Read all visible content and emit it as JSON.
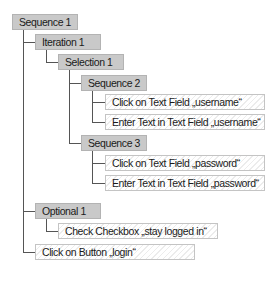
{
  "tree": {
    "sequence1": "Sequence 1",
    "iteration1": "Iteration 1",
    "selection1": "Selection 1",
    "sequence2": "Sequence 2",
    "click_username": "Click on Text Field „username“",
    "enter_username": "Enter Text in Text Field „username“",
    "sequence3": "Sequence 3",
    "click_password": "Click on Text Field „password“",
    "enter_password": "Enter Text in Text Field „password“",
    "optional1": "Optional 1",
    "check_checkbox": "Check Checkbox „stay logged in“",
    "click_login": "Click on Button „login“"
  },
  "colors": {
    "control_node_fill": "#c9c9c9",
    "action_node_fill": "#ffffff",
    "action_node_hatch": "#ececec",
    "connector": "#555555"
  }
}
